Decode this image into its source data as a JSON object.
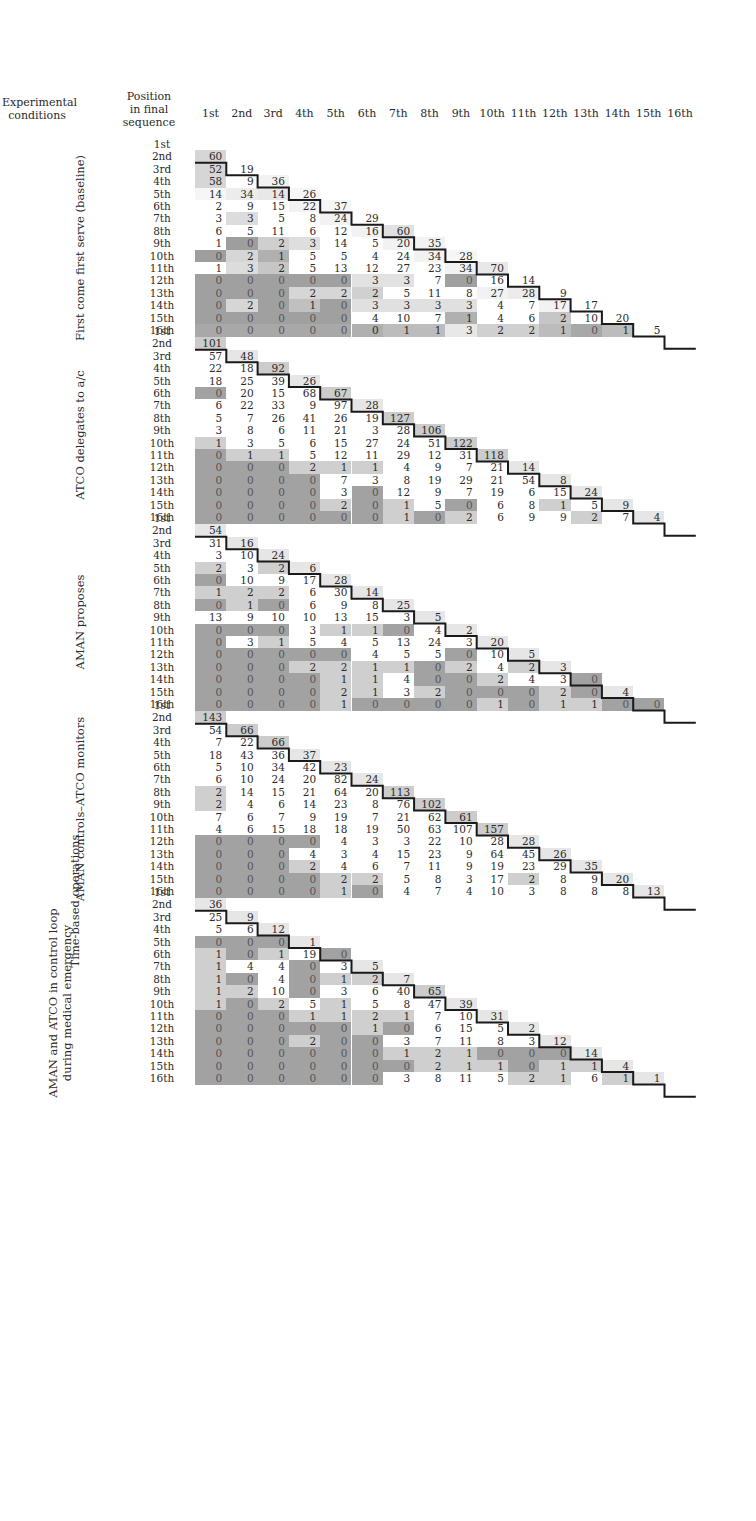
{
  "chart_data": {
    "type": "heatmap",
    "title": "",
    "header": {
      "conditions_label": "Experimental conditions",
      "position_label": "Position in final sequence"
    },
    "columns": [
      "1st",
      "2nd",
      "3rd",
      "4th",
      "5th",
      "6th",
      "7th",
      "8th",
      "9th",
      "10th",
      "11th",
      "12th",
      "13th",
      "14th",
      "15th",
      "16th"
    ],
    "rows": [
      "1st",
      "2nd",
      "3rd",
      "4th",
      "5th",
      "6th",
      "7th",
      "8th",
      "9th",
      "10th",
      "11th",
      "12th",
      "13th",
      "14th",
      "15th",
      "16th"
    ],
    "group_label": "Time-based operations",
    "note": "Lower-triangular matrices; cell shading intensity encodes value relative to expected; staircase line marks diagonal boundary.",
    "blocks": [
      {
        "name": "First come first serve (baseline)",
        "matrix": [
          [],
          [
            60
          ],
          [
            52,
            19
          ],
          [
            58,
            9,
            36
          ],
          [
            14,
            34,
            14,
            26
          ],
          [
            2,
            9,
            15,
            22,
            37
          ],
          [
            3,
            3,
            5,
            8,
            24,
            29
          ],
          [
            6,
            5,
            11,
            6,
            12,
            16,
            60
          ],
          [
            1,
            0,
            2,
            3,
            14,
            5,
            20,
            35
          ],
          [
            0,
            2,
            1,
            5,
            5,
            4,
            24,
            34,
            28
          ],
          [
            1,
            3,
            2,
            5,
            13,
            12,
            27,
            23,
            34,
            70
          ],
          [
            0,
            0,
            0,
            0,
            0,
            3,
            3,
            7,
            0,
            16,
            14
          ],
          [
            0,
            0,
            0,
            2,
            2,
            2,
            5,
            11,
            8,
            27,
            28,
            9
          ],
          [
            0,
            2,
            0,
            1,
            0,
            3,
            3,
            3,
            3,
            4,
            7,
            17,
            17
          ],
          [
            0,
            0,
            0,
            0,
            0,
            4,
            10,
            7,
            1,
            4,
            6,
            2,
            10,
            20
          ],
          [
            0,
            0,
            0,
            0,
            0,
            0,
            1,
            1,
            3,
            2,
            2,
            1,
            0,
            1,
            5
          ]
        ]
      },
      {
        "name": "ATCO delegates to a/c",
        "matrix": [
          [],
          [
            101
          ],
          [
            57,
            48
          ],
          [
            22,
            18,
            92
          ],
          [
            18,
            25,
            39,
            26
          ],
          [
            0,
            20,
            15,
            68,
            67
          ],
          [
            6,
            22,
            33,
            9,
            97,
            28
          ],
          [
            5,
            7,
            26,
            41,
            26,
            19,
            127
          ],
          [
            3,
            8,
            6,
            11,
            21,
            3,
            28,
            106
          ],
          [
            1,
            3,
            5,
            6,
            15,
            27,
            24,
            51,
            122
          ],
          [
            0,
            1,
            1,
            5,
            12,
            11,
            29,
            12,
            31,
            118
          ],
          [
            0,
            0,
            0,
            2,
            1,
            1,
            4,
            9,
            7,
            21,
            14
          ],
          [
            0,
            0,
            0,
            0,
            7,
            3,
            8,
            19,
            29,
            21,
            54,
            8
          ],
          [
            0,
            0,
            0,
            0,
            3,
            0,
            12,
            9,
            7,
            19,
            6,
            15,
            24
          ],
          [
            0,
            0,
            0,
            0,
            2,
            0,
            1,
            5,
            0,
            6,
            8,
            1,
            5,
            9
          ],
          [
            0,
            0,
            0,
            0,
            0,
            0,
            1,
            0,
            2,
            6,
            9,
            9,
            2,
            7,
            4
          ]
        ]
      },
      {
        "name": "AMAN proposes",
        "matrix": [
          [],
          [
            54
          ],
          [
            31,
            16
          ],
          [
            3,
            10,
            24
          ],
          [
            2,
            3,
            2,
            6
          ],
          [
            0,
            10,
            9,
            17,
            28
          ],
          [
            1,
            2,
            2,
            6,
            30,
            14
          ],
          [
            0,
            1,
            0,
            6,
            9,
            8,
            25
          ],
          [
            13,
            9,
            10,
            10,
            13,
            15,
            3,
            5
          ],
          [
            0,
            0,
            0,
            3,
            1,
            1,
            0,
            4,
            2
          ],
          [
            0,
            3,
            1,
            5,
            4,
            5,
            13,
            24,
            3,
            20
          ],
          [
            0,
            0,
            0,
            0,
            0,
            4,
            5,
            5,
            0,
            10,
            5
          ],
          [
            0,
            0,
            0,
            2,
            2,
            1,
            1,
            0,
            2,
            4,
            2,
            3
          ],
          [
            0,
            0,
            0,
            0,
            1,
            1,
            4,
            0,
            0,
            2,
            4,
            3,
            0
          ],
          [
            0,
            0,
            0,
            0,
            2,
            1,
            3,
            2,
            0,
            0,
            0,
            2,
            0,
            4
          ],
          [
            0,
            0,
            0,
            0,
            1,
            0,
            0,
            0,
            0,
            1,
            0,
            1,
            1,
            0,
            0
          ]
        ]
      },
      {
        "name": "AMAN controls–ATCO monitors",
        "matrix": [
          [],
          [
            143
          ],
          [
            54,
            66
          ],
          [
            7,
            22,
            66
          ],
          [
            18,
            43,
            36,
            37
          ],
          [
            5,
            10,
            34,
            42,
            23
          ],
          [
            6,
            10,
            24,
            20,
            82,
            24
          ],
          [
            2,
            14,
            15,
            21,
            64,
            20,
            113
          ],
          [
            2,
            4,
            6,
            14,
            23,
            8,
            76,
            102
          ],
          [
            7,
            6,
            7,
            9,
            19,
            7,
            21,
            62,
            61
          ],
          [
            4,
            6,
            15,
            18,
            18,
            19,
            50,
            63,
            107,
            157
          ],
          [
            0,
            0,
            0,
            0,
            4,
            3,
            3,
            22,
            10,
            28,
            28
          ],
          [
            0,
            0,
            0,
            4,
            3,
            4,
            15,
            23,
            9,
            64,
            45,
            26
          ],
          [
            0,
            0,
            0,
            2,
            4,
            6,
            7,
            11,
            9,
            19,
            23,
            29,
            35
          ],
          [
            0,
            0,
            0,
            0,
            2,
            2,
            5,
            8,
            3,
            17,
            2,
            8,
            9,
            20
          ],
          [
            0,
            0,
            0,
            0,
            1,
            0,
            4,
            7,
            4,
            10,
            3,
            8,
            8,
            8,
            13
          ]
        ]
      },
      {
        "name": "AMAN and ATCO in control loop during medical emergency",
        "matrix": [
          [],
          [
            36
          ],
          [
            25,
            9
          ],
          [
            5,
            6,
            12
          ],
          [
            0,
            0,
            0,
            1
          ],
          [
            1,
            0,
            1,
            19,
            0
          ],
          [
            1,
            4,
            4,
            0,
            3,
            5
          ],
          [
            1,
            0,
            4,
            0,
            1,
            2,
            7
          ],
          [
            1,
            2,
            10,
            0,
            3,
            6,
            40,
            65
          ],
          [
            1,
            0,
            2,
            5,
            1,
            5,
            8,
            47,
            39
          ],
          [
            0,
            0,
            0,
            1,
            1,
            2,
            1,
            7,
            10,
            31
          ],
          [
            0,
            0,
            0,
            0,
            0,
            1,
            0,
            6,
            15,
            5,
            2
          ],
          [
            0,
            0,
            0,
            2,
            0,
            0,
            3,
            7,
            11,
            8,
            3,
            12
          ],
          [
            0,
            0,
            0,
            0,
            0,
            0,
            1,
            2,
            1,
            0,
            0,
            0,
            14
          ],
          [
            0,
            0,
            0,
            0,
            0,
            0,
            0,
            2,
            1,
            1,
            0,
            1,
            1,
            4
          ],
          [
            0,
            0,
            0,
            0,
            0,
            0,
            3,
            8,
            11,
            5,
            2,
            1,
            6,
            1,
            1
          ]
        ]
      }
    ],
    "shades": {
      "b1": [
        [],
        [
          "#d6d6d6"
        ],
        [
          "#d6d6d6",
          "#ffffff"
        ],
        [
          "#d6d6d6",
          "#ffffff",
          "#f2f2f2"
        ],
        [
          "#f6f6f6",
          "#ececec",
          "#e8e8e8",
          "#f6f6f6"
        ],
        [
          "#ffffff",
          "#ffffff",
          "#ffffff",
          "#f2f2f2",
          "#f6f6f6"
        ],
        [
          "#ffffff",
          "#dcdcdc",
          "#ffffff",
          "#ffffff",
          "#f2f2f2",
          "#ffffff"
        ],
        [
          "#ffffff",
          "#ffffff",
          "#ffffff",
          "#ffffff",
          "#ffffff",
          "#f2f2f2",
          "#e0e0e0"
        ],
        [
          "#ffffff",
          "#9e9e9e",
          "#cfcfcf",
          "#dedede",
          "#ffffff",
          "#ffffff",
          "#f2f2f2",
          "#f2f2f2"
        ],
        [
          "#9e9e9e",
          "#d6d6d6",
          "#b0b0b0",
          "#ffffff",
          "#ffffff",
          "#ffffff",
          "#ffffff",
          "#f2f2f2",
          "#f6f6f6"
        ],
        [
          "#ffffff",
          "#dcdcdc",
          "#c6c6c6",
          "#ffffff",
          "#ffffff",
          "#ffffff",
          "#ffffff",
          "#ffffff",
          "#f2f2f2",
          "#e8e8e8"
        ],
        [
          "#a0a0a0",
          "#a0a0a0",
          "#a0a0a0",
          "#a0a0a0",
          "#a0a0a0",
          "#e2e2e2",
          "#e2e2e2",
          "#ffffff",
          "#a0a0a0",
          "#ffffff",
          "#ffffff"
        ],
        [
          "#a0a0a0",
          "#a0a0a0",
          "#a0a0a0",
          "#d6d6d6",
          "#d6d6d6",
          "#d0d0d0",
          "#ffffff",
          "#ffffff",
          "#ffffff",
          "#f2f2f2",
          "#ececec",
          "#ffffff"
        ],
        [
          "#a0a0a0",
          "#d6d6d6",
          "#a0a0a0",
          "#c0c0c0",
          "#a0a0a0",
          "#e0e0e0",
          "#e0e0e0",
          "#e0e0e0",
          "#e0e0e0",
          "#ffffff",
          "#ffffff",
          "#f2f2f2",
          "#ffffff"
        ],
        [
          "#a0a0a0",
          "#a0a0a0",
          "#a0a0a0",
          "#a0a0a0",
          "#a0a0a0",
          "#ffffff",
          "#ffffff",
          "#ffffff",
          "#b0b0b0",
          "#ffffff",
          "#ffffff",
          "#c6c6c6",
          "#ffffff",
          "#ffffff"
        ],
        [
          "#a8a8a8",
          "#a8a8a8",
          "#a8a8a8",
          "#a8a8a8",
          "#a8a8a8",
          "#b0b0b0",
          "#bcbcbc",
          "#bcbcbc",
          "#e8e8e8",
          "#d0d0d0",
          "#d0d0d0",
          "#bcbcbc",
          "#a8a8a8",
          "#bcbcbc",
          "#ffffff"
        ]
      ]
    }
  }
}
